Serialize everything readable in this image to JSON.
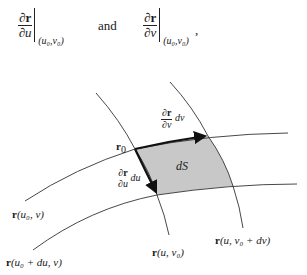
{
  "header": {
    "left_expr": {
      "num_partial": "∂",
      "num_vec": "r",
      "den": "∂u",
      "eval_point": "(u₀,v₀)"
    },
    "connector": "and",
    "right_expr": {
      "num_partial": "∂",
      "num_vec": "r",
      "den": "∂v",
      "eval_point": "(u₀,v₀)"
    },
    "trailing": ","
  },
  "diagram": {
    "patch_label": "dS",
    "patch_fill": "#c8c8c8",
    "point_label": {
      "vec": "r",
      "sub": "0"
    },
    "dv_vector_label": {
      "num_partial": "∂",
      "num_vec": "r",
      "den": "∂v",
      "factor": "dv"
    },
    "du_vector_label": {
      "num_partial": "∂",
      "num_vec": "r",
      "den": "∂u",
      "factor": "du"
    },
    "curve_labels": {
      "u0_v": {
        "vec": "r",
        "args": "(u₀, v)"
      },
      "u0du_v": {
        "vec": "r",
        "args": "(u₀ + du, v)"
      },
      "u_v0": {
        "vec": "r",
        "args": "(u, v₀)"
      },
      "u_v0dv": {
        "vec": "r",
        "args": "(u, v₀ + dv)"
      }
    }
  }
}
